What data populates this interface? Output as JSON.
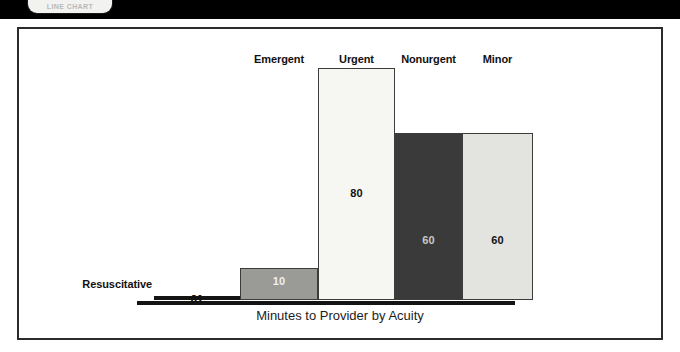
{
  "header": {
    "button_label": "LINE CHART"
  },
  "figure": {
    "axis_title": "Minutes to Provider by Acuity"
  },
  "chart_data": {
    "type": "bar",
    "title": "",
    "xlabel": "Minutes to Provider by Acuity",
    "ylabel": "",
    "ylim": [
      0,
      80
    ],
    "grid": false,
    "legend": "none",
    "categories": [
      "Resuscitative",
      "Emergent",
      "Urgent",
      "Nonurgent",
      "Minor"
    ],
    "values": [
      0,
      10,
      80,
      60,
      60
    ],
    "value_labels": [
      "01",
      "10",
      "80",
      "60",
      "60"
    ],
    "bars": [
      {
        "category": "Resuscitative",
        "value": 0,
        "value_label": "01",
        "fill": "#141414",
        "value_color": "#111111",
        "width_px": 86,
        "height_px": 4
      },
      {
        "category": "Emergent",
        "value": 10,
        "value_label": "10",
        "fill": "#9a9a97",
        "value_color": "#efefed",
        "width_px": 78,
        "height_px": 32
      },
      {
        "category": "Urgent",
        "value": 80,
        "value_label": "80",
        "fill": "#f6f6f3",
        "value_color": "#111111",
        "width_px": 77,
        "height_px": 232
      },
      {
        "category": "Nonurgent",
        "value": 60,
        "value_label": "60",
        "fill": "#3a3a3a",
        "value_color": "#c9c9c6",
        "width_px": 67,
        "height_px": 167
      },
      {
        "category": "Minor",
        "value": 60,
        "value_label": "60",
        "fill": "#e3e3e0",
        "value_color": "#111111",
        "width_px": 71,
        "height_px": 167
      }
    ]
  }
}
